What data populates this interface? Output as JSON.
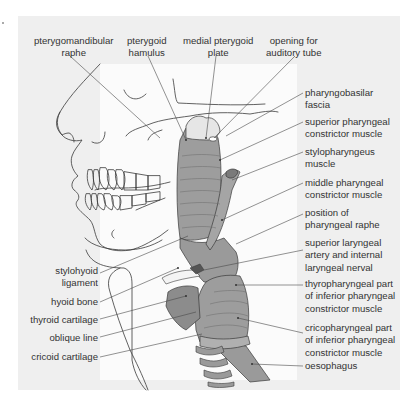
{
  "diagram": {
    "type": "anatomical-illustration",
    "colors": {
      "panel_bg": "#efefef",
      "inner_bg": "#fbfbfb",
      "muscle_fill": "#9d9d9d",
      "muscle_dark": "#8a8a8a",
      "line": "#3a3a3a",
      "text": "#333333"
    },
    "top_labels": [
      {
        "line1": "pterygomandibular",
        "line2": "raphe"
      },
      {
        "line1": "pterygoid",
        "line2": "hamulus"
      },
      {
        "line1": "medial pterygoid",
        "line2": "plate"
      },
      {
        "line1": "opening for",
        "line2": "auditory tube"
      }
    ],
    "right_labels": [
      {
        "line1": "pharyngobasilar",
        "line2": "fascia"
      },
      {
        "line1": "superior pharyngeal",
        "line2": "constrictor muscle"
      },
      {
        "line1": "stylopharyngeus",
        "line2": "muscle"
      },
      {
        "line1": "middle pharyngeal",
        "line2": "constrictor muscle"
      },
      {
        "line1": "position of",
        "line2": "pharyngeal raphe"
      },
      {
        "line1": "superior laryngeal",
        "line2": "artery and internal",
        "line3": "laryngeal nerval"
      },
      {
        "line1": "thyropharyngeal part",
        "line2": "of inferior pharyngeal",
        "line3": "constrictor muscle"
      },
      {
        "line1": "cricopharyngeal part",
        "line2": "of inferior pharyngeal",
        "line3": "constrictor muscle"
      },
      {
        "line1": "oesophagus"
      }
    ],
    "left_labels": [
      {
        "line1": "stylohyoid",
        "line2": "ligament"
      },
      {
        "line1": "hyoid bone"
      },
      {
        "line1": "thyroid cartilage"
      },
      {
        "line1": "oblique line"
      },
      {
        "line1": "cricoid cartilage"
      }
    ]
  }
}
